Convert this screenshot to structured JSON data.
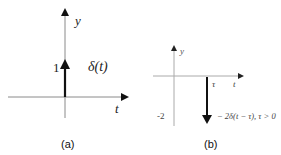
{
  "panels": [
    {
      "caption": "(a)",
      "y_axis_label": "y",
      "x_axis_label": "t",
      "impulse_value_label": "1",
      "impulse_label": "δ(t)",
      "impulse": {
        "position": 0,
        "amplitude": 1,
        "direction": "up"
      }
    },
    {
      "caption": "(b)",
      "y_axis_label": "y",
      "x_axis_label": "t",
      "tick_label": "τ",
      "impulse_value_label": "-2",
      "impulse_label": "− 2δ(t − τ), τ > 0",
      "impulse": {
        "position": "τ",
        "amplitude": -2,
        "direction": "down"
      }
    }
  ],
  "colors": {
    "axis": "#8a8a8a",
    "impulse": "#111111",
    "text": "#222222"
  }
}
